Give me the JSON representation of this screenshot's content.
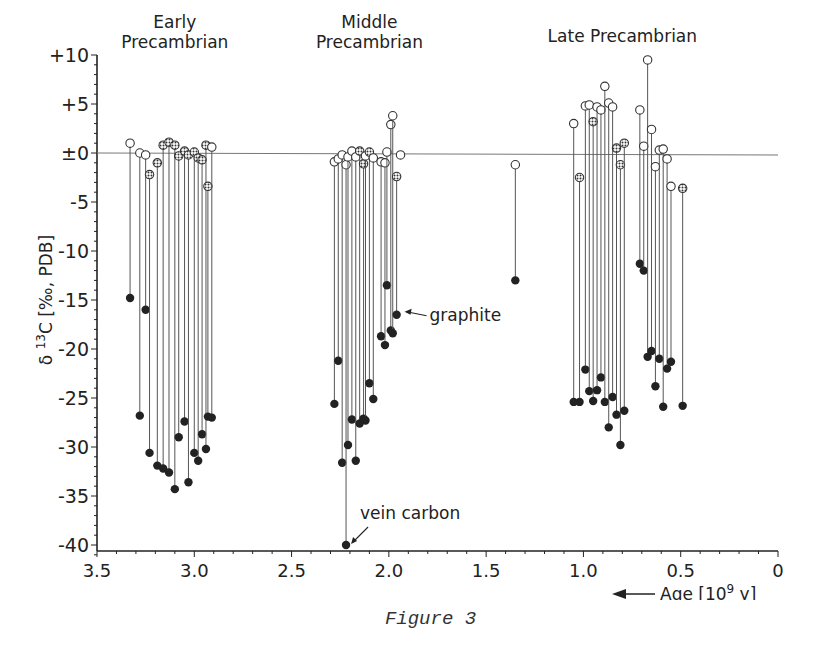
{
  "chart_data": {
    "type": "scatter",
    "subtype": "paired-dropline",
    "title": "",
    "xlabel": "Age [10^9 y]",
    "xlabel_parts": {
      "text": "Age [10",
      "sup": "9",
      "tail": " y]"
    },
    "ylabel": "δ13C [‰, PDB]",
    "ylabel_parts": {
      "pre": "δ ",
      "sup": "13",
      "tail": "C [‰, PDB]"
    },
    "xlim": [
      3.5,
      0
    ],
    "ylim": [
      -41,
      10
    ],
    "x_reversed": true,
    "x_ticks": [
      "3.5",
      "3.0",
      "2.5",
      "2.0",
      "1.5",
      "1.0",
      "0.5",
      "0"
    ],
    "x_tick_values": [
      3.5,
      3.0,
      2.5,
      2.0,
      1.5,
      1.0,
      0.5,
      0
    ],
    "y_ticks": [
      "+10",
      "+5",
      "±0",
      "-5",
      "-10",
      "-15",
      "-20",
      "-25",
      "-30",
      "-35",
      "-40"
    ],
    "y_tick_values": [
      10,
      5,
      0,
      -5,
      -10,
      -15,
      -20,
      -25,
      -30,
      -35,
      -40
    ],
    "grid": false,
    "zero_line": true,
    "legend": null,
    "group_labels": [
      {
        "text": [
          "Early",
          "Precambrian"
        ],
        "x": 3.1
      },
      {
        "text": [
          "Middle",
          "Precambrian"
        ],
        "x": 2.1
      },
      {
        "text": [
          "Late Precambrian"
        ],
        "x": 0.8
      }
    ],
    "annotations": [
      {
        "text": "graphite",
        "x": 1.95,
        "y": -16.5
      },
      {
        "text": "vein carbon",
        "x": 2.22,
        "y": -40
      },
      {
        "text": "Age [10^9 y]",
        "arrow": "left"
      }
    ],
    "marker_legend": {
      "open_circle": "carbonate carbon (open)",
      "hatched": "carbonate carbon (hatched/dolomite)",
      "filled": "organic carbon"
    },
    "series": [
      {
        "name": "Early Precambrian",
        "pairs": [
          {
            "x": 3.33,
            "carb": 1.0,
            "carb_marker": "open",
            "org": -14.8
          },
          {
            "x": 3.28,
            "carb": 0.0,
            "carb_marker": "open",
            "org": -26.8
          },
          {
            "x": 3.25,
            "carb": -0.2,
            "carb_marker": "open",
            "org": -16.0
          },
          {
            "x": 3.23,
            "carb": -2.2,
            "carb_marker": "hatched",
            "org": -30.6
          },
          {
            "x": 3.19,
            "carb": -1.0,
            "carb_marker": "hatched",
            "org": -31.9
          },
          {
            "x": 3.16,
            "carb": 0.8,
            "carb_marker": "hatched",
            "org": -32.2
          },
          {
            "x": 3.13,
            "carb": 1.1,
            "carb_marker": "hatched",
            "org": -32.6
          },
          {
            "x": 3.1,
            "carb": 0.8,
            "carb_marker": "hatched",
            "org": -34.3
          },
          {
            "x": 3.08,
            "carb": -0.3,
            "carb_marker": "hatched",
            "org": -29.0
          },
          {
            "x": 3.05,
            "carb": 0.2,
            "carb_marker": "hatched",
            "org": -27.4
          },
          {
            "x": 3.03,
            "carb": -0.2,
            "carb_marker": "hatched",
            "org": -33.6
          },
          {
            "x": 3.0,
            "carb": 0.1,
            "carb_marker": "hatched",
            "org": -30.6
          },
          {
            "x": 2.98,
            "carb": -0.5,
            "carb_marker": "hatched",
            "org": -31.4
          },
          {
            "x": 2.96,
            "carb": -0.7,
            "carb_marker": "hatched",
            "org": -28.7
          },
          {
            "x": 2.94,
            "carb": 0.8,
            "carb_marker": "hatched",
            "org": -30.2
          },
          {
            "x": 2.93,
            "carb": -3.4,
            "carb_marker": "hatched",
            "org": -26.9
          },
          {
            "x": 2.91,
            "carb": 0.6,
            "carb_marker": "open",
            "org": -27.0
          }
        ]
      },
      {
        "name": "Middle Precambrian",
        "pairs": [
          {
            "x": 2.28,
            "carb": -0.9,
            "carb_marker": "open",
            "org": -25.6
          },
          {
            "x": 2.26,
            "carb": -0.6,
            "carb_marker": "open",
            "org": -21.2
          },
          {
            "x": 2.24,
            "carb": -0.2,
            "carb_marker": "open",
            "org": -31.6
          },
          {
            "x": 2.22,
            "carb": -1.2,
            "carb_marker": "open",
            "org": -40.0
          },
          {
            "x": 2.21,
            "carb": -0.4,
            "carb_marker": "open",
            "org": -29.8
          },
          {
            "x": 2.19,
            "carb": 0.2,
            "carb_marker": "open",
            "org": -27.2
          },
          {
            "x": 2.17,
            "carb": -0.4,
            "carb_marker": "open",
            "org": -31.4
          },
          {
            "x": 2.15,
            "carb": 0.2,
            "carb_marker": "hatched",
            "org": -27.6
          },
          {
            "x": 2.13,
            "carb": -1.1,
            "carb_marker": "hatched",
            "org": -27.1
          },
          {
            "x": 2.12,
            "carb": -0.3,
            "carb_marker": "open",
            "org": -27.3
          },
          {
            "x": 2.1,
            "carb": 0.1,
            "carb_marker": "hatched",
            "org": -23.5
          },
          {
            "x": 2.08,
            "carb": -0.5,
            "carb_marker": "open",
            "org": -25.1
          },
          {
            "x": 2.04,
            "carb": -0.9,
            "carb_marker": "open",
            "org": -18.7
          },
          {
            "x": 2.02,
            "carb": -1.0,
            "carb_marker": "open",
            "org": -19.6
          },
          {
            "x": 2.01,
            "carb": 0.1,
            "carb_marker": "open",
            "org": -13.5
          },
          {
            "x": 1.99,
            "carb": 2.9,
            "carb_marker": "open",
            "org": -18.1
          },
          {
            "x": 1.98,
            "carb": 3.8,
            "carb_marker": "open",
            "org": -18.4
          },
          {
            "x": 1.96,
            "carb": -2.4,
            "carb_marker": "hatched",
            "org": -16.5
          },
          {
            "x": 1.94,
            "carb": -0.2,
            "carb_marker": "open",
            "org": null
          }
        ]
      },
      {
        "name": "Isolated",
        "pairs": [
          {
            "x": 1.35,
            "carb": -1.2,
            "carb_marker": "open",
            "org": -13.0
          }
        ]
      },
      {
        "name": "Late Precambrian",
        "pairs": [
          {
            "x": 1.05,
            "carb": 3.0,
            "carb_marker": "open",
            "org": -25.4
          },
          {
            "x": 1.02,
            "carb": -2.5,
            "carb_marker": "hatched",
            "org": -25.4
          },
          {
            "x": 0.99,
            "carb": 4.8,
            "carb_marker": "open",
            "org": -22.1
          },
          {
            "x": 0.97,
            "carb": 4.9,
            "carb_marker": "open",
            "org": -24.3
          },
          {
            "x": 0.95,
            "carb": 3.2,
            "carb_marker": "hatched",
            "org": -25.3
          },
          {
            "x": 0.93,
            "carb": 4.7,
            "carb_marker": "open",
            "org": -24.2
          },
          {
            "x": 0.91,
            "carb": 4.4,
            "carb_marker": "open",
            "org": -22.9
          },
          {
            "x": 0.89,
            "carb": 6.8,
            "carb_marker": "open",
            "org": -25.4
          },
          {
            "x": 0.87,
            "carb": 5.1,
            "carb_marker": "open",
            "org": -28.0
          },
          {
            "x": 0.85,
            "carb": 4.7,
            "carb_marker": "open",
            "org": -24.9
          },
          {
            "x": 0.83,
            "carb": 0.5,
            "carb_marker": "hatched",
            "org": -26.7
          },
          {
            "x": 0.81,
            "carb": -1.2,
            "carb_marker": "hatched",
            "org": -29.8
          },
          {
            "x": 0.79,
            "carb": 1.0,
            "carb_marker": "hatched",
            "org": -26.3
          },
          {
            "x": 0.71,
            "carb": 4.4,
            "carb_marker": "open",
            "org": -11.3
          },
          {
            "x": 0.69,
            "carb": 0.7,
            "carb_marker": "open",
            "org": -12.0
          },
          {
            "x": 0.67,
            "carb": 9.5,
            "carb_marker": "open",
            "org": -20.8
          },
          {
            "x": 0.65,
            "carb": 2.4,
            "carb_marker": "open",
            "org": -20.2
          },
          {
            "x": 0.63,
            "carb": -1.4,
            "carb_marker": "open",
            "org": -23.8
          },
          {
            "x": 0.61,
            "carb": 0.3,
            "carb_marker": "open",
            "org": -21.0
          },
          {
            "x": 0.59,
            "carb": 0.4,
            "carb_marker": "open",
            "org": -25.9
          },
          {
            "x": 0.57,
            "carb": -0.6,
            "carb_marker": "open",
            "org": -22.0
          },
          {
            "x": 0.55,
            "carb": -3.4,
            "carb_marker": "open",
            "org": -21.3
          },
          {
            "x": 0.49,
            "carb": -3.6,
            "carb_marker": "hatched",
            "org": -25.8
          }
        ]
      }
    ]
  },
  "figure": {
    "caption": "Figure 3"
  },
  "colors": {
    "ink": "#222222",
    "line": "#555555",
    "background": "#ffffff"
  }
}
